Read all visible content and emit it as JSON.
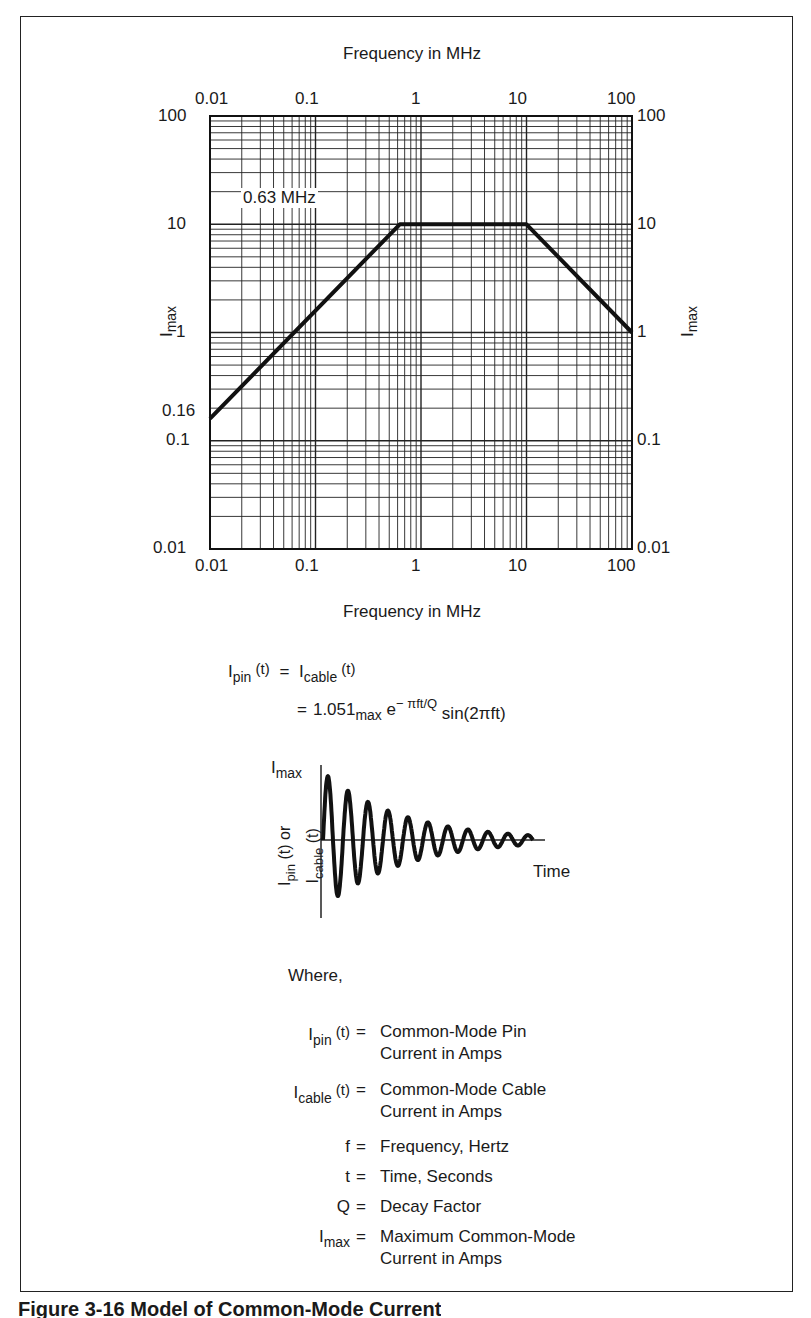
{
  "chart_data": {
    "type": "line",
    "title": "",
    "xlabel": "Frequency in MHz",
    "ylabel": "I_max",
    "x_scale": "log",
    "y_scale": "log",
    "xlim": [
      0.01,
      100
    ],
    "ylim": [
      0.01,
      100
    ],
    "grid": true,
    "x_tick_labels": [
      "0.01",
      "0.1",
      "1",
      "10",
      "100"
    ],
    "y_tick_labels": [
      "100",
      "10",
      "1",
      "0.1",
      "0.01"
    ],
    "series": [
      {
        "name": "I_max envelope",
        "x": [
          0.01,
          0.63,
          10,
          100
        ],
        "y": [
          0.16,
          10,
          10,
          1
        ]
      }
    ],
    "annotations": [
      {
        "text": "0.63 MHz",
        "x": 0.63,
        "y": 10
      },
      {
        "text": "0.16",
        "x": 0.01,
        "y": 0.16
      }
    ]
  },
  "chart": {
    "top_axis_label": "Frequency in MHz",
    "bottom_axis_label": "Frequency in MHz",
    "left_axis_label": "I",
    "left_axis_label_sub": "max",
    "right_axis_label": "I",
    "right_axis_label_sub": "max",
    "x_ticks": [
      "0.01",
      "0.1",
      "1",
      "10",
      "100"
    ],
    "y_ticks": [
      "100",
      "10",
      "1",
      "0.1",
      "0.01"
    ],
    "annotation_breakpoint": "0.63 MHz",
    "annotation_start": "0.16"
  },
  "equation": {
    "line1_lhs": "I",
    "line1_lhs_sub": "pin",
    "line1_lhs_arg": " (t)",
    "line1_eq": "=",
    "line1_rhs": "I",
    "line1_rhs_sub": "cable",
    "line1_rhs_arg": " (t)",
    "line2_eq": "=",
    "line2_coef": "1.051",
    "line2_coef_sub": "max",
    "line2_exp_base": " e",
    "line2_exp": "− πft/Q",
    "line2_sin": " sin(2πft)"
  },
  "waveform": {
    "y_top_label": "I",
    "y_top_label_sub": "max",
    "y_axis_label_part1": "I",
    "y_axis_label_part1_sub": "pin",
    "y_axis_label_part1_arg": " (t) or",
    "y_axis_label_part2": "I",
    "y_axis_label_part2_sub": "cable",
    "y_axis_label_part2_arg": " (t)",
    "x_axis_label": "Time"
  },
  "definitions": {
    "heading": "Where,",
    "items": [
      {
        "sym": "I",
        "sub": "pin",
        "arg": " (t)",
        "eq": "=",
        "text": [
          "Common-Mode Pin",
          "Current in Amps"
        ]
      },
      {
        "sym": "I",
        "sub": "cable",
        "arg": " (t)",
        "eq": "=",
        "text": [
          "Common-Mode Cable",
          "Current in Amps"
        ]
      },
      {
        "sym": "f",
        "sub": "",
        "arg": "",
        "eq": "=",
        "text": [
          "Frequency, Hertz"
        ]
      },
      {
        "sym": "t",
        "sub": "",
        "arg": "",
        "eq": "=",
        "text": [
          "Time, Seconds"
        ]
      },
      {
        "sym": "Q",
        "sub": "",
        "arg": "",
        "eq": "=",
        "text": [
          "Decay Factor"
        ]
      },
      {
        "sym": "I",
        "sub": "max",
        "arg": "",
        "eq": "=",
        "text": [
          "Maximum Common-Mode",
          "Current in Amps"
        ]
      }
    ]
  },
  "caption": {
    "text": "Figure 3-16  Model of Common-Mode Current"
  }
}
